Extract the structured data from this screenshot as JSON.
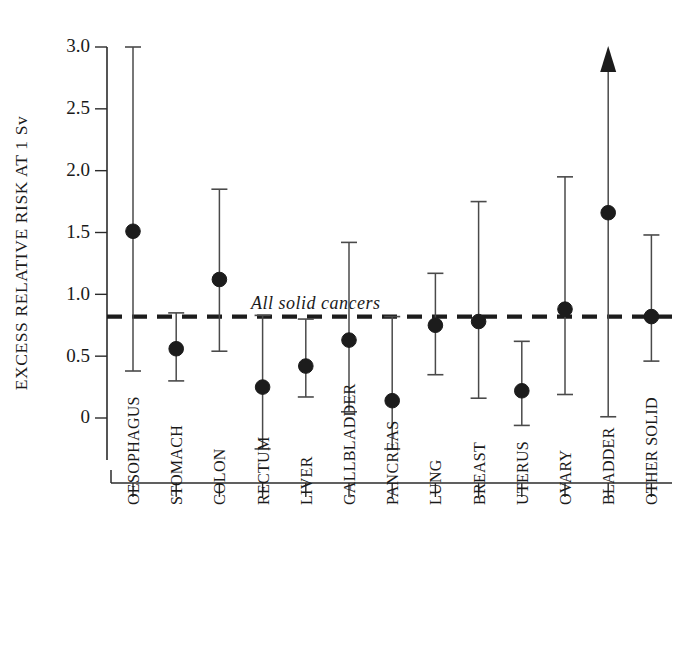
{
  "chart_data": {
    "type": "scatter",
    "title": "",
    "xlabel": "",
    "ylabel": "EXCESS RELATIVE RISK AT 1 Sv",
    "ylim": [
      -0.35,
      3.05
    ],
    "yticks": [
      0,
      0.5,
      1.0,
      1.5,
      2.0,
      2.5,
      3.0
    ],
    "ytick_labels": [
      "0",
      "0.5",
      "1.0",
      "1.5",
      "2.0",
      "2.5",
      "3.0"
    ],
    "grid": false,
    "legend": "none",
    "categories": [
      "OESOPHAGUS",
      "STOMACH",
      "COLON",
      "RECTUM",
      "LIVER",
      "GALLBLADDER",
      "PANCREAS",
      "LUNG",
      "BREAST",
      "UTERUS",
      "OVARY",
      "BLADDER",
      "OTHER SOLID"
    ],
    "values": [
      1.51,
      0.56,
      1.12,
      0.25,
      0.42,
      0.63,
      0.14,
      0.75,
      0.78,
      0.22,
      0.88,
      1.66,
      0.82
    ],
    "ci_low": [
      0.38,
      0.3,
      0.54,
      -0.25,
      0.17,
      0.05,
      -0.25,
      0.35,
      0.16,
      -0.06,
      0.19,
      0.01,
      0.46
    ],
    "ci_high": [
      3.0,
      0.85,
      1.85,
      0.83,
      0.8,
      1.42,
      0.82,
      1.17,
      1.75,
      0.62,
      1.95,
      3.0,
      1.48
    ],
    "ci_high_truncated": [
      false,
      false,
      false,
      false,
      false,
      false,
      false,
      false,
      false,
      false,
      false,
      true,
      false
    ],
    "reference_line": {
      "value": 0.82,
      "label": "All  solid  cancers",
      "style": "dashed"
    },
    "colors": {
      "marker": "#1c1c1c",
      "error_bar": "#4a4a4a",
      "axis": "#2b2b2b",
      "reference": "#1c1c1c",
      "background": "#ffffff"
    }
  }
}
